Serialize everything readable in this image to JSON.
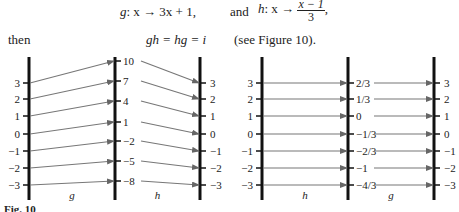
{
  "text": {
    "g_def_lhs": "g",
    "g_def_rhs": ": x → 3x + 1,",
    "and": "and",
    "h_def_lhs": "h",
    "h_def_mid": ": x →",
    "h_frac_num": "x − 1",
    "h_frac_den": "3",
    "h_comma": ",",
    "then": "then",
    "identity": "gh = hg = i",
    "see_fig": "(see Figure 10).",
    "caption": "Fig. 10"
  },
  "figures": [
    {
      "name": "g-then-h",
      "first_map_label": "g",
      "second_map_label": "h",
      "inputs": [
        "3",
        "2",
        "1",
        "0",
        "−1",
        "−2",
        "−3"
      ],
      "middle": [
        "10",
        "7",
        "4",
        "1",
        "−2",
        "−5",
        "−8"
      ],
      "outputs": [
        "3",
        "2",
        "1",
        "0",
        "−1",
        "−2",
        "−3"
      ]
    },
    {
      "name": "h-then-g",
      "first_map_label": "h",
      "second_map_label": "g",
      "inputs": [
        "3",
        "2",
        "1",
        "0",
        "−1",
        "−2",
        "−3"
      ],
      "middle": [
        "2/3",
        "1/3",
        "0",
        "−1/3",
        "−2/3",
        "−1",
        "−4/3"
      ],
      "outputs": [
        "3",
        "2",
        "1",
        "0",
        "−1",
        "−2",
        "−3"
      ]
    }
  ]
}
